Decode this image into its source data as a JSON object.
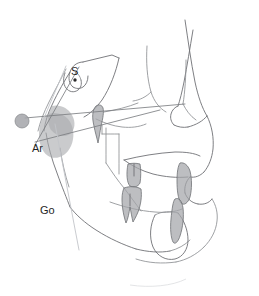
{
  "figure": {
    "type": "cephalometric-tracing",
    "background_color": "#ffffff"
  },
  "colors": {
    "outline": "#6f7175",
    "outline_soft": "#8e9094",
    "reference_line": "#7c7e82",
    "reference_line_light": "#c3c5c9",
    "tooth_fill": "#a3a5a9",
    "bone_fill": "#a9abaf",
    "landmark_dot": "#2b2b2b",
    "label_text": "#1f1f1f"
  },
  "landmarks": [
    {
      "id": "S",
      "label": "S",
      "name": "sella",
      "label_x": 71,
      "label_y": 75,
      "dot_x": 75,
      "dot_y": 80,
      "has_dot": true
    },
    {
      "id": "Ar",
      "label": "Ar",
      "name": "articulare",
      "label_x": 32,
      "label_y": 152,
      "dot_x": 0,
      "dot_y": 0,
      "has_dot": false
    },
    {
      "id": "Go",
      "label": "Go",
      "name": "gonion",
      "label_x": 40,
      "label_y": 214,
      "dot_x": 0,
      "dot_y": 0,
      "has_dot": false
    }
  ],
  "markers": [
    {
      "id": "porion-marker",
      "name": "gray-circle-marker",
      "cx": 22,
      "cy": 121,
      "r": 7
    }
  ],
  "reference_lines": [
    {
      "id": "frankfort-line",
      "name": "horizontal-reference-line",
      "x1": 25,
      "y1": 118,
      "x2": 185,
      "y2": 104
    },
    {
      "id": "sn-line",
      "name": "sella-nasion-diagonal-line",
      "x1": 78,
      "y1": 68,
      "x2": 36,
      "y2": 143
    },
    {
      "id": "ramus-line",
      "name": "ramus-plane-line",
      "x1": 54,
      "y1": 126,
      "x2": 78,
      "y2": 249
    },
    {
      "id": "mandibular-line",
      "name": "mandibular-plane-line",
      "x1": 35,
      "y1": 140,
      "x2": 160,
      "y2": 110
    }
  ],
  "teeth": [
    {
      "id": "upper-molar",
      "name": "upper-molar"
    },
    {
      "id": "lower-molar",
      "name": "lower-molar"
    },
    {
      "id": "upper-incisor",
      "name": "upper-incisor"
    },
    {
      "id": "lower-incisor",
      "name": "lower-incisor"
    },
    {
      "id": "pterygoid-shape",
      "name": "pterygoid-marking"
    }
  ],
  "structures": [
    {
      "id": "cranial-base",
      "name": "cranial-base-outline"
    },
    {
      "id": "sella-turcica",
      "name": "sella-turcica-outline"
    },
    {
      "id": "nasal-profile",
      "name": "soft-tissue-nasal-profile"
    },
    {
      "id": "lip-profile",
      "name": "soft-tissue-lip-profile"
    },
    {
      "id": "maxilla",
      "name": "maxilla-outline"
    },
    {
      "id": "mandible",
      "name": "mandible-outline"
    },
    {
      "id": "symphysis",
      "name": "mandibular-symphysis-outline"
    },
    {
      "id": "orbit",
      "name": "orbital-floor-outline"
    }
  ]
}
